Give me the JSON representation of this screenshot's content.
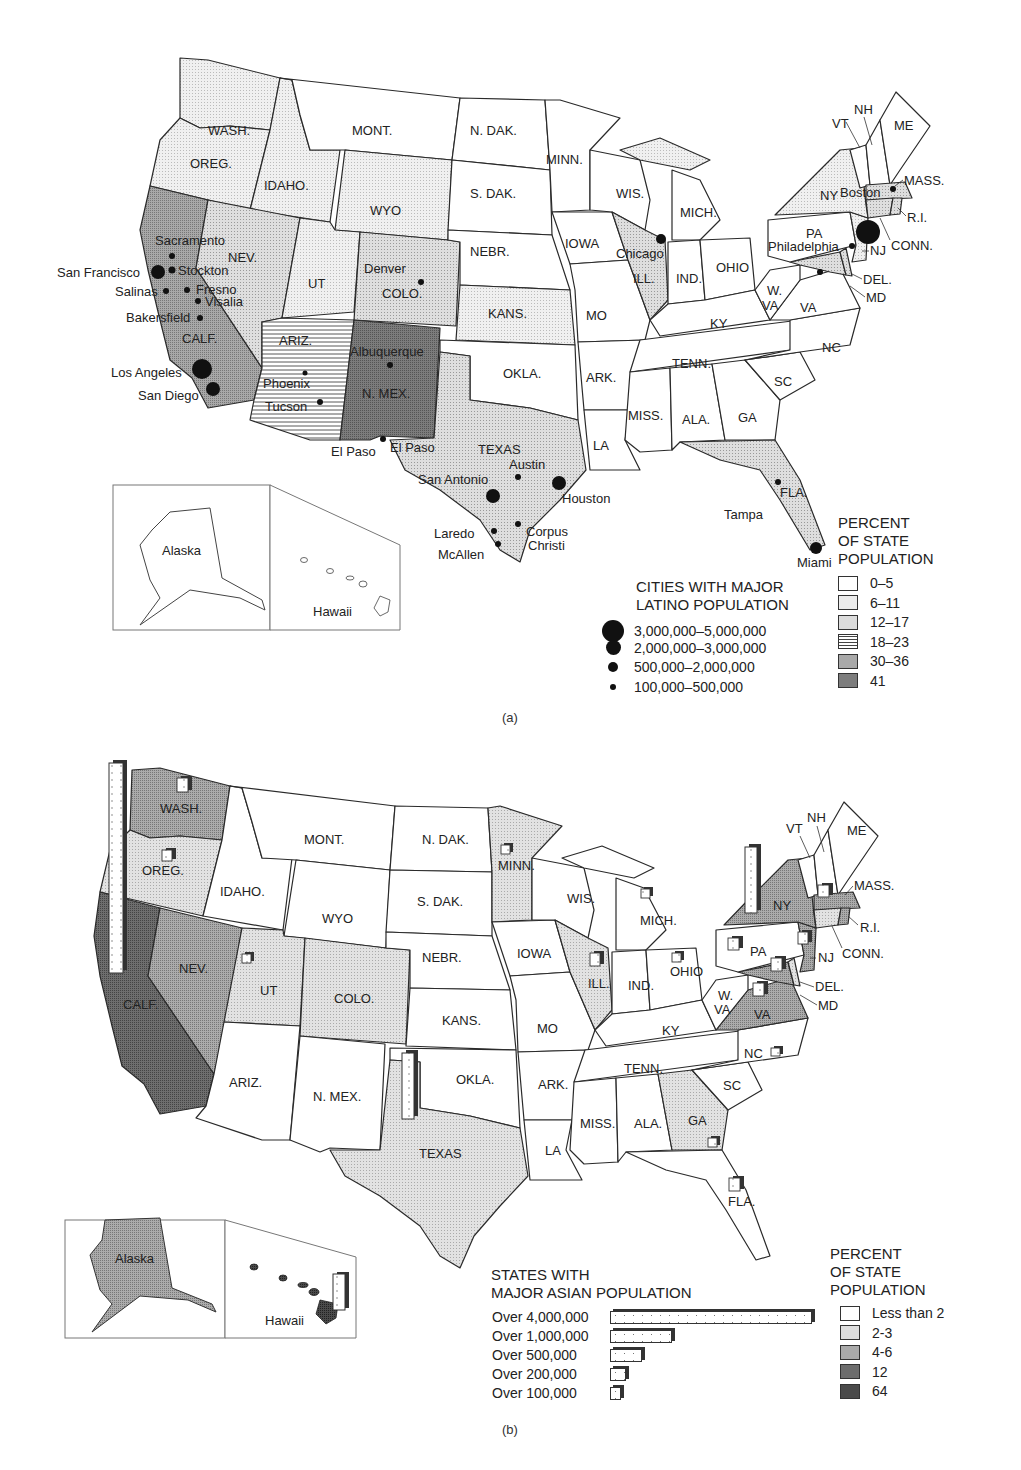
{
  "colors": {
    "bin_white": "#ffffff",
    "bin_light": "#ececec",
    "bin_lightmed": "#dcdcdc",
    "bin_hatched": "#ffffff",
    "bin_medium": "#a9a9a9",
    "bin_dark": "#7d7d7d",
    "asian_white": "#ffffff",
    "asian_light": "#dedede",
    "asian_medium": "#aaaaaa",
    "asian_dark": "#6d6d6d",
    "asian_darkest": "#4a4a4a",
    "line": "#2a2a2a"
  },
  "map_a": {
    "panel_label": "(a)",
    "state_labels": {
      "wash": "WASH.",
      "oreg": "OREG.",
      "calf": "CALF.",
      "idaho": "IDAHO.",
      "nev": "NEV.",
      "mont": "MONT.",
      "wyo": "WYO",
      "ut": "UT",
      "colo": "COLO.",
      "ariz": "ARIZ.",
      "nmex": "N. MEX.",
      "ndak": "N. DAK.",
      "sdak": "S. DAK.",
      "nebr": "NEBR.",
      "kans": "KANS.",
      "okla": "OKLA.",
      "texas": "TEXAS",
      "minn": "MINN.",
      "iowa": "IOWA",
      "mo": "MO",
      "ark": "ARK.",
      "la": "LA",
      "wis": "WIS.",
      "ill": "ILL.",
      "mich": "MICH.",
      "ind": "IND.",
      "ohio": "OHIO",
      "ky": "KY",
      "tenn": "TENN.",
      "miss": "MISS.",
      "ala": "ALA.",
      "ga": "GA",
      "fla": "FLA.",
      "sc": "SC",
      "nc": "NC",
      "va": "VA",
      "wva1": "W.",
      "wva2": "VA",
      "pa": "PA",
      "ny": "NY",
      "vt": "VT",
      "nh": "NH",
      "me": "ME",
      "mass": "MASS.",
      "ri": "R.I.",
      "conn": "CONN.",
      "nj": "NJ",
      "del": "DEL.",
      "md": "MD",
      "alaska": "Alaska",
      "hawaii": "Hawaii"
    },
    "cities": {
      "sacramento": "Sacramento",
      "san_francisco": "San Francisco",
      "stockton": "Stockton",
      "salinas": "Salinas",
      "fresno": "Fresno",
      "visalia": "Visalia",
      "bakersfield": "Bakersfield",
      "los_angeles": "Los Angeles",
      "san_diego": "San Diego",
      "phoenix": "Phoenix",
      "tucson": "Tucson",
      "albuquerque": "Albuquerque",
      "denver": "Denver",
      "el_paso": "El Paso",
      "el_paso_2": "El Paso",
      "san_antonio": "San Antonio",
      "austin": "Austin",
      "houston": "Houston",
      "laredo": "Laredo",
      "mcallen": "McAllen",
      "corpus1": "Corpus",
      "corpus2": "Christi",
      "chicago": "Chicago",
      "philadelphia": "Philadelphia",
      "boston": "Boston",
      "tampa": "Tampa",
      "miami": "Miami"
    },
    "cities_legend": {
      "title_line1": "CITIES WITH MAJOR",
      "title_line2": "LATINO POPULATION",
      "items": [
        {
          "label": "3,000,000–5,000,000",
          "size": 22
        },
        {
          "label": "2,000,000–3,000,000",
          "size": 15
        },
        {
          "label": "500,000–2,000,000",
          "size": 10
        },
        {
          "label": "100,000–500,000",
          "size": 6
        }
      ]
    },
    "percent_legend": {
      "title_line1": "PERCENT",
      "title_line2": "OF STATE",
      "title_line3": "POPULATION",
      "items": [
        {
          "label": "0–5",
          "fill": "white"
        },
        {
          "label": "6–11",
          "fill": "light"
        },
        {
          "label": "12–17",
          "fill": "lightmed"
        },
        {
          "label": "18–23",
          "fill": "hatched"
        },
        {
          "label": "30–36",
          "fill": "medium"
        },
        {
          "label": "41",
          "fill": "dark"
        }
      ]
    }
  },
  "map_b": {
    "panel_label": "(b)",
    "state_labels": {
      "wash": "WASH.",
      "oreg": "OREG.",
      "calf": "CALF.",
      "idaho": "IDAHO.",
      "nev": "NEV.",
      "mont": "MONT.",
      "wyo": "WYO",
      "ut": "UT",
      "colo": "COLO.",
      "ariz": "ARIZ.",
      "nmex": "N. MEX.",
      "ndak": "N. DAK.",
      "sdak": "S. DAK.",
      "nebr": "NEBR.",
      "kans": "KANS.",
      "okla": "OKLA.",
      "texas": "TEXAS",
      "minn": "MINN.",
      "iowa": "IOWA",
      "mo": "MO",
      "ark": "ARK.",
      "la": "LA",
      "wis": "WIS.",
      "ill": "ILL.",
      "mich": "MICH.",
      "ind": "IND.",
      "ohio": "OHIO",
      "ky": "KY",
      "tenn": "TENN.",
      "miss": "MISS.",
      "ala": "ALA.",
      "ga": "GA",
      "fla": "FLA.",
      "sc": "SC",
      "nc": "NC",
      "va": "VA",
      "wva1": "W.",
      "wva2": "VA",
      "pa": "PA",
      "ny": "NY",
      "vt": "VT",
      "nh": "NH",
      "me": "ME",
      "mass": "MASS.",
      "ri": "R.I.",
      "conn": "CONN.",
      "nj": "NJ",
      "del": "DEL.",
      "md": "MD",
      "alaska": "Alaska",
      "hawaii": "Hawaii"
    },
    "asian_legend": {
      "title_line1": "STATES WITH",
      "title_line2": "MAJOR ASIAN POPULATION",
      "items": [
        {
          "label": "Over 4,000,000",
          "width": 202
        },
        {
          "label": "Over 1,000,000",
          "width": 62
        },
        {
          "label": "Over 500,000",
          "width": 32
        },
        {
          "label": "Over 200,000",
          "width": 16
        },
        {
          "label": "Over 100,000",
          "width": 11
        }
      ]
    },
    "percent_legend": {
      "title_line1": "PERCENT",
      "title_line2": "OF STATE",
      "title_line3": "POPULATION",
      "items": [
        {
          "label": "Less than 2",
          "fill": "asian_white"
        },
        {
          "label": "2-3",
          "fill": "asian_light"
        },
        {
          "label": "4-6",
          "fill": "asian_medium"
        },
        {
          "label": "12",
          "fill": "asian_dark"
        },
        {
          "label": "64",
          "fill": "asian_darkest"
        }
      ]
    }
  },
  "chart_data": [
    {
      "type": "choropleth",
      "title": "Cities with major Latino population / percent of state population (a)",
      "legend_bins": [
        "0–5",
        "6–11",
        "12–17",
        "18–23",
        "30–36",
        "41"
      ],
      "states": {
        "CALF.": "30–36",
        "TEXAS": "30–36",
        "N. MEX.": "41",
        "ARIZ.": "18–23",
        "NEV.": "12–17",
        "COLO.": "12–17",
        "WASH.": "6–11",
        "OREG.": "6–11",
        "IDAHO.": "6–11",
        "UT": "6–11",
        "WYO": "6–11",
        "KANS.": "6–11",
        "ILL.": "6–11",
        "NY": "12–17",
        "NJ": "12–17",
        "FLA.": "12–17",
        "CONN.": "6–11",
        "R.I.": "6–11",
        "MASS.": "6–11",
        "MD": "6–11"
      },
      "city_size_bins": [
        "3,000,000–5,000,000",
        "2,000,000–3,000,000",
        "500,000–2,000,000",
        "100,000–500,000"
      ],
      "cities": [
        "Sacramento",
        "San Francisco",
        "Stockton",
        "Salinas",
        "Fresno",
        "Visalia",
        "Bakersfield",
        "Los Angeles",
        "San Diego",
        "Phoenix",
        "Tucson",
        "Albuquerque",
        "Denver",
        "El Paso",
        "San Antonio",
        "Austin",
        "Houston",
        "Laredo",
        "McAllen",
        "Corpus Christi",
        "Chicago",
        "Philadelphia",
        "Boston",
        "Tampa",
        "Miami"
      ]
    },
    {
      "type": "choropleth",
      "title": "States with major Asian population / percent of state population (b)",
      "legend_bins": [
        "Less than 2",
        "2-3",
        "4-6",
        "12",
        "64"
      ],
      "states": {
        "CALF.": "12",
        "WASH.": "4-6",
        "NEV.": "4-6",
        "NY": "4-6",
        "NJ": "4-6",
        "VA": "4-6",
        "MD": "4-6",
        "MASS.": "4-6",
        "OREG.": "2-3",
        "UT": "2-3",
        "COLO.": "2-3",
        "MINN.": "2-3",
        "ILL.": "2-3",
        "TEXAS": "2-3",
        "GA": "2-3",
        "CONN.": "2-3",
        "Alaska": "4-6",
        "Hawaii": "64"
      },
      "bar_bins": [
        "Over 4,000,000",
        "Over 1,000,000",
        "Over 500,000",
        "Over 200,000",
        "Over 100,000"
      ]
    }
  ]
}
